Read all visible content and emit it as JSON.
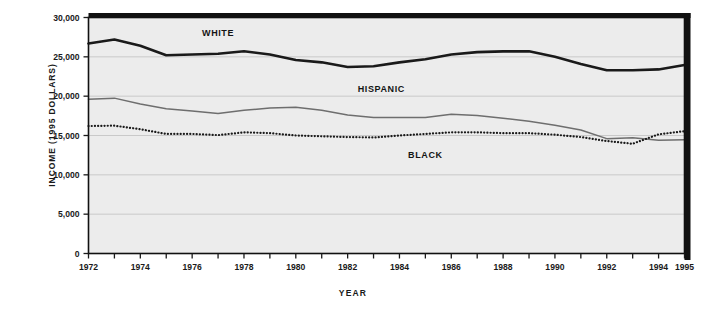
{
  "chart_data": {
    "type": "line",
    "title": "",
    "xlabel": "YEAR",
    "ylabel": "INCOME (1995 DOLLARS)",
    "xlim": [
      1972,
      1995
    ],
    "ylim": [
      0,
      30000
    ],
    "grid": true,
    "legend_position": "inline-labels",
    "x": [
      1972,
      1973,
      1974,
      1975,
      1976,
      1977,
      1978,
      1979,
      1980,
      1981,
      1982,
      1983,
      1984,
      1985,
      1986,
      1987,
      1988,
      1989,
      1990,
      1991,
      1992,
      1993,
      1994,
      1995
    ],
    "xtick_values": [
      1972,
      1973,
      1974,
      1975,
      1976,
      1977,
      1978,
      1979,
      1980,
      1981,
      1982,
      1983,
      1984,
      1985,
      1986,
      1987,
      1988,
      1989,
      1990,
      1991,
      1992,
      1993,
      1994,
      1995
    ],
    "xtick_labels": [
      "1972",
      "",
      "1974",
      "",
      "1976",
      "",
      "1978",
      "",
      "1980",
      "",
      "1982",
      "",
      "1984",
      "",
      "1986",
      "",
      "1988",
      "",
      "1990",
      "",
      "1992",
      "",
      "1994",
      "1995"
    ],
    "ytick_values": [
      0,
      5000,
      10000,
      15000,
      20000,
      25000,
      30000
    ],
    "ytick_labels": [
      "0",
      "5,000",
      "10,000",
      "15,000",
      "20,000",
      "25,000",
      "30,000"
    ],
    "series": [
      {
        "name": "WHITE",
        "style": "solid-thick-black",
        "color": "#1a1a1a",
        "label_x": 1977.0,
        "label_y": 27700,
        "values": [
          26700,
          27200,
          26400,
          25200,
          25300,
          25400,
          25700,
          25300,
          24600,
          24300,
          23700,
          23800,
          24300,
          24700,
          25300,
          25600,
          25700,
          25700,
          25000,
          24100,
          23300,
          23300,
          23400,
          23950
        ]
      },
      {
        "name": "HISPANIC",
        "style": "solid-thin-gray",
        "color": "#6e6e6e",
        "label_x": 1983.3,
        "label_y": 20500,
        "values": [
          19600,
          19750,
          19000,
          18400,
          18100,
          17800,
          18200,
          18500,
          18600,
          18200,
          17600,
          17300,
          17300,
          17300,
          17700,
          17550,
          17200,
          16800,
          16300,
          15700,
          14600,
          14700,
          14400,
          14450
        ]
      },
      {
        "name": "BLACK",
        "style": "dotted-black",
        "color": "#1a1a1a",
        "label_x": 1985.0,
        "label_y": 12100,
        "values": [
          16200,
          16250,
          15800,
          15200,
          15200,
          15050,
          15400,
          15300,
          15000,
          14900,
          14800,
          14750,
          15000,
          15200,
          15400,
          15400,
          15300,
          15300,
          15100,
          14800,
          14300,
          13950,
          15150,
          15550
        ]
      }
    ]
  },
  "axes": {
    "plot_bg": "#ececec",
    "border_color": "#111111",
    "gridline_color": "#c9c9c9"
  }
}
